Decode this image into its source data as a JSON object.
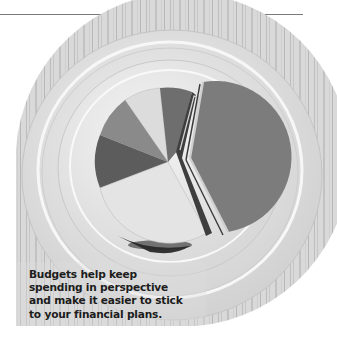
{
  "caption": {
    "lines": [
      "Budgets help keep",
      "spending in perspective",
      "and make it easier to stick",
      "to your financial plans."
    ]
  },
  "photo": {
    "subject": "pie-chart-shaped cake on stacked white plates",
    "style": "grayscale",
    "slices": [
      {
        "shade": "#6e6e6e"
      },
      {
        "shade": "#7c7c7c"
      },
      {
        "shade": "#e4e4e4"
      },
      {
        "shade": "#5c5c5c"
      },
      {
        "shade": "#8a8a8a"
      },
      {
        "shade": "#dcdcdc"
      }
    ]
  },
  "colors": {
    "rule": "#7a7a7a",
    "caption_text": "#1c1c1c",
    "background": "#ffffff"
  }
}
